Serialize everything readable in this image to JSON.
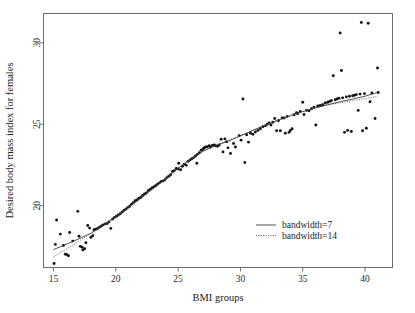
{
  "figure": {
    "background_color": "#ffffff",
    "frame_color": "#6e6e6e",
    "point_color": "#111111"
  },
  "chart_data": {
    "type": "scatter",
    "title": "",
    "xlabel": "BMI groups",
    "ylabel": "Desired body mass index for females",
    "xlim": [
      14.2,
      42.2
    ],
    "ylim": [
      16.2,
      31.8
    ],
    "xticks": [
      15,
      20,
      25,
      30,
      35,
      40
    ],
    "yticks": [
      20,
      25,
      30
    ],
    "xticklabels": [
      "15",
      "20",
      "25",
      "30",
      "35",
      "40"
    ],
    "yticklabels": [
      "20",
      "25",
      "30"
    ],
    "grid": false,
    "legend_position": "center-right",
    "legend": [
      {
        "label": "bandwidth=7",
        "style": "solid"
      },
      {
        "label": "bandwidth=14",
        "style": "dotted"
      }
    ],
    "points": [
      [
        15.05,
        16.45
      ],
      [
        15.15,
        17.62
      ],
      [
        15.25,
        19.12
      ],
      [
        15.55,
        18.25
      ],
      [
        15.8,
        17.55
      ],
      [
        15.95,
        17.02
      ],
      [
        16.05,
        17.0
      ],
      [
        16.2,
        16.92
      ],
      [
        16.3,
        18.35
      ],
      [
        16.55,
        17.82
      ],
      [
        16.95,
        19.65
      ],
      [
        17.05,
        18.12
      ],
      [
        17.15,
        17.5
      ],
      [
        17.3,
        17.45
      ],
      [
        17.35,
        17.28
      ],
      [
        17.5,
        17.35
      ],
      [
        17.6,
        17.72
      ],
      [
        17.75,
        18.78
      ],
      [
        17.9,
        18.62
      ],
      [
        18.0,
        18.05
      ],
      [
        18.15,
        18.15
      ],
      [
        18.25,
        18.52
      ],
      [
        18.4,
        18.55
      ],
      [
        18.55,
        18.6
      ],
      [
        18.7,
        18.68
      ],
      [
        18.85,
        18.75
      ],
      [
        19.0,
        18.82
      ],
      [
        19.15,
        18.88
      ],
      [
        19.3,
        18.9
      ],
      [
        19.45,
        19.0
      ],
      [
        19.6,
        18.6
      ],
      [
        19.75,
        19.18
      ],
      [
        19.9,
        19.28
      ],
      [
        20.05,
        19.35
      ],
      [
        20.2,
        19.42
      ],
      [
        20.35,
        19.5
      ],
      [
        20.5,
        19.6
      ],
      [
        20.65,
        19.7
      ],
      [
        20.8,
        19.78
      ],
      [
        20.95,
        19.88
      ],
      [
        21.1,
        19.95
      ],
      [
        21.25,
        20.08
      ],
      [
        21.4,
        20.18
      ],
      [
        21.55,
        20.3
      ],
      [
        21.7,
        20.35
      ],
      [
        21.85,
        20.45
      ],
      [
        22.0,
        20.5
      ],
      [
        22.15,
        20.62
      ],
      [
        22.3,
        20.72
      ],
      [
        22.45,
        20.78
      ],
      [
        22.6,
        20.92
      ],
      [
        22.75,
        21.0
      ],
      [
        22.9,
        21.08
      ],
      [
        23.05,
        21.15
      ],
      [
        23.2,
        21.22
      ],
      [
        23.35,
        21.32
      ],
      [
        23.5,
        21.4
      ],
      [
        23.65,
        21.48
      ],
      [
        23.8,
        21.52
      ],
      [
        23.95,
        21.6
      ],
      [
        24.1,
        21.72
      ],
      [
        24.25,
        21.8
      ],
      [
        24.4,
        21.9
      ],
      [
        24.55,
        22.1
      ],
      [
        24.7,
        22.15
      ],
      [
        24.85,
        22.28
      ],
      [
        25.0,
        22.25
      ],
      [
        25.05,
        22.6
      ],
      [
        25.2,
        22.2
      ],
      [
        25.35,
        22.42
      ],
      [
        25.5,
        22.55
      ],
      [
        25.65,
        22.48
      ],
      [
        25.8,
        22.72
      ],
      [
        25.95,
        22.8
      ],
      [
        26.1,
        22.88
      ],
      [
        26.25,
        22.95
      ],
      [
        26.4,
        23.05
      ],
      [
        26.5,
        22.6
      ],
      [
        26.55,
        23.15
      ],
      [
        26.7,
        23.25
      ],
      [
        26.85,
        23.4
      ],
      [
        27.0,
        23.48
      ],
      [
        27.1,
        23.55
      ],
      [
        27.2,
        23.6
      ],
      [
        27.35,
        23.62
      ],
      [
        27.5,
        23.68
      ],
      [
        27.6,
        23.6
      ],
      [
        27.75,
        23.7
      ],
      [
        27.9,
        23.72
      ],
      [
        28.0,
        23.68
      ],
      [
        28.15,
        23.65
      ],
      [
        28.3,
        23.72
      ],
      [
        28.45,
        24.08
      ],
      [
        28.6,
        23.3
      ],
      [
        28.75,
        24.1
      ],
      [
        28.9,
        23.92
      ],
      [
        29.0,
        23.55
      ],
      [
        29.2,
        23.2
      ],
      [
        29.45,
        23.82
      ],
      [
        29.6,
        23.6
      ],
      [
        29.9,
        24.3
      ],
      [
        30.05,
        24.02
      ],
      [
        30.2,
        26.55
      ],
      [
        30.35,
        22.65
      ],
      [
        30.5,
        24.35
      ],
      [
        30.65,
        23.9
      ],
      [
        30.8,
        24.45
      ],
      [
        31.0,
        24.38
      ],
      [
        31.2,
        24.52
      ],
      [
        31.4,
        24.62
      ],
      [
        31.6,
        24.72
      ],
      [
        31.8,
        24.85
      ],
      [
        32.0,
        24.9
      ],
      [
        32.15,
        25.0
      ],
      [
        32.3,
        25.08
      ],
      [
        32.45,
        24.95
      ],
      [
        32.6,
        25.12
      ],
      [
        32.75,
        25.35
      ],
      [
        32.9,
        24.6
      ],
      [
        33.05,
        25.22
      ],
      [
        33.2,
        24.6
      ],
      [
        33.35,
        25.38
      ],
      [
        33.5,
        25.38
      ],
      [
        33.6,
        24.45
      ],
      [
        33.75,
        25.48
      ],
      [
        33.9,
        24.5
      ],
      [
        34.0,
        24.62
      ],
      [
        34.15,
        24.72
      ],
      [
        34.3,
        25.58
      ],
      [
        34.5,
        25.7
      ],
      [
        34.6,
        25.65
      ],
      [
        34.8,
        25.78
      ],
      [
        35.0,
        26.35
      ],
      [
        35.1,
        25.6
      ],
      [
        35.3,
        25.85
      ],
      [
        35.5,
        25.82
      ],
      [
        35.7,
        25.95
      ],
      [
        35.9,
        26.05
      ],
      [
        36.05,
        24.95
      ],
      [
        36.2,
        26.12
      ],
      [
        36.4,
        26.15
      ],
      [
        36.6,
        26.2
      ],
      [
        36.8,
        26.3
      ],
      [
        37.0,
        26.35
      ],
      [
        37.15,
        26.4
      ],
      [
        37.3,
        26.45
      ],
      [
        37.45,
        27.98
      ],
      [
        37.6,
        26.5
      ],
      [
        37.75,
        26.55
      ],
      [
        37.9,
        26.6
      ],
      [
        38.0,
        30.6
      ],
      [
        38.1,
        28.3
      ],
      [
        38.2,
        26.62
      ],
      [
        38.35,
        24.5
      ],
      [
        38.5,
        26.68
      ],
      [
        38.6,
        24.62
      ],
      [
        38.75,
        26.72
      ],
      [
        38.9,
        24.55
      ],
      [
        39.0,
        26.75
      ],
      [
        39.15,
        26.78
      ],
      [
        39.3,
        26.82
      ],
      [
        39.45,
        25.85
      ],
      [
        39.6,
        26.85
      ],
      [
        39.7,
        31.25
      ],
      [
        39.8,
        24.6
      ],
      [
        39.95,
        26.88
      ],
      [
        40.1,
        24.75
      ],
      [
        40.25,
        31.2
      ],
      [
        40.4,
        26.38
      ],
      [
        40.55,
        26.92
      ],
      [
        40.8,
        25.35
      ],
      [
        41.0,
        28.45
      ],
      [
        41.05,
        26.95
      ]
    ],
    "series": [
      {
        "name": "bandwidth=7",
        "style": "solid",
        "x": [
          15.0,
          16.0,
          17.0,
          18.0,
          19.0,
          20.0,
          21.0,
          22.0,
          23.0,
          24.0,
          25.0,
          26.0,
          27.0,
          28.0,
          29.0,
          30.0,
          31.0,
          32.0,
          33.0,
          34.0,
          35.0,
          36.0,
          37.0,
          38.0,
          39.0,
          40.0,
          41.0
        ],
        "y": [
          17.3,
          17.62,
          17.95,
          18.3,
          18.78,
          19.3,
          19.88,
          20.45,
          21.05,
          21.65,
          22.3,
          22.85,
          23.35,
          23.68,
          23.95,
          24.28,
          24.62,
          24.95,
          25.25,
          25.52,
          25.78,
          26.0,
          26.2,
          26.38,
          26.55,
          26.72,
          26.95
        ]
      },
      {
        "name": "bandwidth=14",
        "style": "dotted",
        "x": [
          15.0,
          16.0,
          17.0,
          18.0,
          19.0,
          20.0,
          21.0,
          22.0,
          23.0,
          24.0,
          25.0,
          26.0,
          27.0,
          28.0,
          29.0,
          30.0,
          31.0,
          32.0,
          33.0,
          34.0,
          35.0,
          36.0,
          37.0,
          38.0,
          39.0,
          40.0,
          41.0
        ],
        "y": [
          16.85,
          17.32,
          17.8,
          18.3,
          18.82,
          19.35,
          19.9,
          20.48,
          21.08,
          21.68,
          22.28,
          22.85,
          23.32,
          23.7,
          24.0,
          24.3,
          24.62,
          24.95,
          25.25,
          25.52,
          25.78,
          26.0,
          26.18,
          26.32,
          26.45,
          26.58,
          26.7
        ]
      }
    ]
  }
}
